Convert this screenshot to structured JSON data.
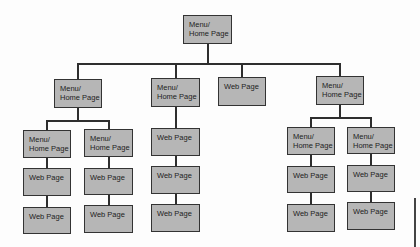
{
  "diagram": {
    "type": "site-hierarchy",
    "root": {
      "id": "root",
      "label": "Menu/\nHome Page"
    },
    "level1": [
      {
        "id": "m1",
        "label": "Menu/\nHome Page"
      },
      {
        "id": "m2",
        "label": "Menu/\nHome Page"
      },
      {
        "id": "w3",
        "label": "Web Page"
      },
      {
        "id": "m4",
        "label": "Menu/\nHome Page"
      }
    ],
    "columns": [
      {
        "parent": "m1",
        "nodes": [
          "Menu/\nHome Page",
          "Web Page",
          "Web Page"
        ]
      },
      {
        "parent": "m1",
        "nodes": [
          "Menu/\nHome Page",
          "Web Page",
          "Web Page"
        ]
      },
      {
        "parent": "m2",
        "nodes": [
          "Web Page",
          "Web Page",
          "Web Page"
        ]
      },
      {
        "parent": "m4",
        "nodes": [
          "Menu/\nHome Page",
          "Web Page",
          "Web Page"
        ]
      },
      {
        "parent": "m4",
        "nodes": [
          "Menu/\nHome Page",
          "Web Page",
          "Web Page"
        ]
      }
    ],
    "colors": {
      "box_fill": "#b6b6b6",
      "box_border": "#333333",
      "line": "#2e2e2e"
    }
  }
}
